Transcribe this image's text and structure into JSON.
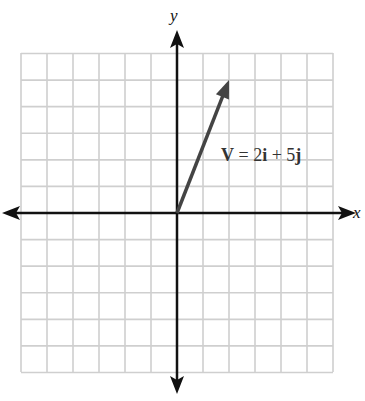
{
  "chart_data": {
    "type": "vector-diagram",
    "title": "",
    "xlabel": "x",
    "ylabel": "y",
    "grid": true,
    "xlim": [
      -6,
      6
    ],
    "ylim": [
      -6,
      6
    ],
    "grid_step": 1,
    "vectors": [
      {
        "name": "V",
        "from": [
          0,
          0
        ],
        "to": [
          2,
          5
        ],
        "label": "V = 2i + 5j",
        "color": "#444444"
      }
    ]
  },
  "labels": {
    "x_axis": "x",
    "y_axis": "y",
    "vector_name": "V",
    "equals": " = 2",
    "i_unit": "i",
    "plus": " + 5",
    "j_unit": "j"
  },
  "colors": {
    "grid": "#cfcfcf",
    "axis": "#111111",
    "vector": "#444444"
  }
}
